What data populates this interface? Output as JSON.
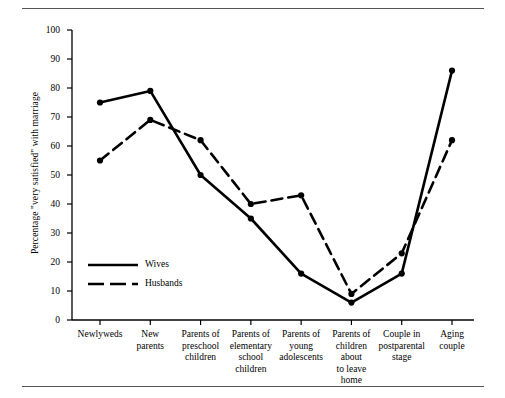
{
  "chart_data": {
    "type": "line",
    "title": "",
    "xlabel": "",
    "ylabel": "Percentage \"very satisfied\" with marriage",
    "ylim": [
      0,
      100
    ],
    "ytick_values": [
      0,
      10,
      20,
      30,
      40,
      50,
      60,
      70,
      80,
      90,
      100
    ],
    "ytick_labels": [
      "0",
      "10",
      "20",
      "30",
      "40",
      "50",
      "60",
      "70",
      "80",
      "90",
      "100"
    ],
    "grid": false,
    "legend_position": "inside-lower-left",
    "categories": [
      "Newlyweds",
      "New parents",
      "Parents of preschool children",
      "Parents of elementary school children",
      "Parents of young adolescents",
      "Parents of children about to leave home",
      "Couple in postparental stage",
      "Aging couple"
    ],
    "category_lines": [
      [
        "Newlyweds"
      ],
      [
        "New",
        "parents"
      ],
      [
        "Parents of",
        "preschool",
        "children"
      ],
      [
        "Parents of",
        "elementary",
        "school",
        "children"
      ],
      [
        "Parents of",
        "young",
        "adolescents"
      ],
      [
        "Parents of",
        "children",
        "about",
        "to leave",
        "home"
      ],
      [
        "Couple in",
        "postparental",
        "stage"
      ],
      [
        "Aging",
        "couple"
      ]
    ],
    "series": [
      {
        "name": "Wives",
        "style": "solid",
        "color": "#000000",
        "values": [
          75,
          79,
          50,
          35,
          16,
          6,
          16,
          86
        ]
      },
      {
        "name": "Husbands",
        "style": "dashed",
        "color": "#000000",
        "values": [
          55,
          69,
          62,
          40,
          43,
          9,
          23,
          62
        ]
      }
    ]
  },
  "legend": {
    "entries": [
      {
        "label": "Wives",
        "style": "solid"
      },
      {
        "label": "Husbands",
        "style": "dashed"
      }
    ]
  }
}
